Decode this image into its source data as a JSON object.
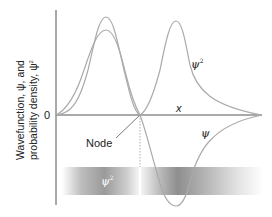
{
  "figure": {
    "y_axis_label_line1": "Wavefunction, ψ, and",
    "y_axis_label_line2": "probability density, ψ",
    "y_axis_label_sup": "2",
    "zero_label": "0",
    "x_axis_label": "x",
    "node_label": "Node",
    "psi_label": "ψ",
    "psi2_label": "ψ",
    "psi2_sup": "2",
    "band_label": "ψ",
    "band_sup": "2"
  },
  "colors": {
    "axis": "#555555",
    "curve": "#a8a8a8",
    "text": "#222222",
    "band_dark": "#8a8a8a",
    "band_light": "#ffffff"
  }
}
